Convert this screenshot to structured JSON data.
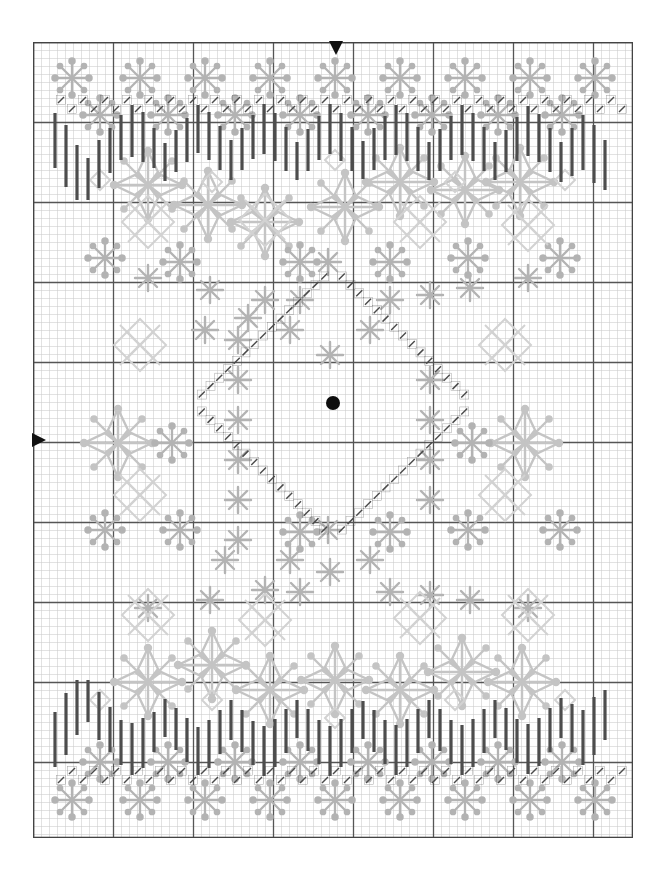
{
  "document": {
    "title": "Snowflake Blackwork Cross-Stitch Chart",
    "type": "stitch-pattern-chart"
  },
  "grid": {
    "cell_size_px": 8,
    "bold_every_n_cells": 10,
    "columns": 75,
    "rows": 99,
    "origin_x_px": 33,
    "origin_y_px": 42,
    "width_px": 600,
    "height_px": 796,
    "fine_line_color": "#c9c9c9",
    "bold_line_color": "#555555",
    "border_color": "#444444",
    "background_color": "#ffffff"
  },
  "palette": {
    "motif_light_grey": "#c4c4c4",
    "motif_mid_grey": "#b3b3b3",
    "motif_pale_grey": "#d2d2d2",
    "backstitch_dark": "#4a4a4a",
    "border_bar_dark": "#4d4d4d",
    "center_dot": "#0d0d0d",
    "arrow_marker": "#111111"
  },
  "markers": {
    "center_dot": {
      "name": "center-point",
      "x_px": 333,
      "y_px": 403,
      "radius_px": 7,
      "color": "#0d0d0d"
    },
    "top_arrow": {
      "name": "top-center-arrow",
      "direction": "down",
      "x_px": 336,
      "y_px": 47,
      "color": "#111111"
    },
    "left_arrow": {
      "name": "left-center-arrow",
      "direction": "right",
      "x_px": 38,
      "y_px": 440,
      "color": "#111111"
    }
  },
  "legend": {
    "symbols": [
      {
        "key": "large-snowflake",
        "label": "Large 8-point snowflake",
        "color": "#c4c4c4"
      },
      {
        "key": "six-spoke-star",
        "label": "Six-spoke dotted star",
        "color": "#bdbdbd"
      },
      {
        "key": "asterisk-star",
        "label": "Small asterisk star",
        "color": "#b5b5b5"
      },
      {
        "key": "diamond-cluster",
        "label": "Four diamond cluster",
        "color": "#c8c8c8"
      },
      {
        "key": "single-diamond",
        "label": "Single small diamond",
        "color": "#cccccc"
      },
      {
        "key": "border-bar",
        "label": "Vertical border bar",
        "color": "#4d4d4d"
      },
      {
        "key": "backstitch",
        "label": "Backstitch tick",
        "color": "#4a4a4a"
      }
    ]
  },
  "chart_data": {
    "type": "pattern-chart",
    "grid_columns": 75,
    "grid_rows": 99,
    "border_bars": {
      "note": "Dark vertical bars forming zigzag border bands top and bottom",
      "top_band_y_px": 100,
      "bottom_band_y_px": 700,
      "bars": [
        {
          "x": 55,
          "y": 113,
          "h": 55
        },
        {
          "x": 66,
          "y": 125,
          "h": 62
        },
        {
          "x": 77,
          "y": 145,
          "h": 55
        },
        {
          "x": 88,
          "y": 158,
          "h": 42
        },
        {
          "x": 99,
          "y": 140,
          "h": 48
        },
        {
          "x": 110,
          "y": 128,
          "h": 45
        },
        {
          "x": 121,
          "y": 115,
          "h": 45
        },
        {
          "x": 132,
          "y": 105,
          "h": 52
        },
        {
          "x": 143,
          "y": 112,
          "h": 50
        },
        {
          "x": 154,
          "y": 128,
          "h": 40
        },
        {
          "x": 165,
          "y": 143,
          "h": 38
        },
        {
          "x": 176,
          "y": 130,
          "h": 42
        },
        {
          "x": 187,
          "y": 118,
          "h": 44
        },
        {
          "x": 198,
          "y": 105,
          "h": 48
        },
        {
          "x": 209,
          "y": 112,
          "h": 48
        },
        {
          "x": 220,
          "y": 126,
          "h": 44
        },
        {
          "x": 231,
          "y": 140,
          "h": 40
        },
        {
          "x": 242,
          "y": 128,
          "h": 42
        },
        {
          "x": 253,
          "y": 115,
          "h": 44
        },
        {
          "x": 264,
          "y": 104,
          "h": 50
        },
        {
          "x": 275,
          "y": 113,
          "h": 48
        },
        {
          "x": 286,
          "y": 127,
          "h": 44
        },
        {
          "x": 297,
          "y": 142,
          "h": 38
        },
        {
          "x": 308,
          "y": 129,
          "h": 42
        },
        {
          "x": 319,
          "y": 116,
          "h": 44
        },
        {
          "x": 330,
          "y": 104,
          "h": 50
        },
        {
          "x": 341,
          "y": 113,
          "h": 48
        },
        {
          "x": 352,
          "y": 127,
          "h": 44
        },
        {
          "x": 363,
          "y": 141,
          "h": 38
        },
        {
          "x": 374,
          "y": 128,
          "h": 42
        },
        {
          "x": 385,
          "y": 116,
          "h": 44
        },
        {
          "x": 396,
          "y": 105,
          "h": 50
        },
        {
          "x": 407,
          "y": 113,
          "h": 48
        },
        {
          "x": 418,
          "y": 127,
          "h": 44
        },
        {
          "x": 429,
          "y": 142,
          "h": 38
        },
        {
          "x": 440,
          "y": 129,
          "h": 42
        },
        {
          "x": 451,
          "y": 116,
          "h": 44
        },
        {
          "x": 462,
          "y": 105,
          "h": 50
        },
        {
          "x": 473,
          "y": 113,
          "h": 48
        },
        {
          "x": 484,
          "y": 127,
          "h": 44
        },
        {
          "x": 495,
          "y": 142,
          "h": 38
        },
        {
          "x": 506,
          "y": 130,
          "h": 42
        },
        {
          "x": 517,
          "y": 117,
          "h": 44
        },
        {
          "x": 528,
          "y": 106,
          "h": 50
        },
        {
          "x": 539,
          "y": 114,
          "h": 48
        },
        {
          "x": 550,
          "y": 128,
          "h": 44
        },
        {
          "x": 561,
          "y": 142,
          "h": 40
        },
        {
          "x": 572,
          "y": 128,
          "h": 48
        },
        {
          "x": 583,
          "y": 115,
          "h": 55
        },
        {
          "x": 594,
          "y": 125,
          "h": 58
        },
        {
          "x": 605,
          "y": 140,
          "h": 50
        }
      ]
    },
    "motifs": {
      "large_snowflake_positions": [
        {
          "x": 148,
          "y": 185
        },
        {
          "x": 265,
          "y": 222
        },
        {
          "x": 345,
          "y": 207
        },
        {
          "x": 400,
          "y": 182
        },
        {
          "x": 465,
          "y": 190
        },
        {
          "x": 520,
          "y": 182
        },
        {
          "x": 208,
          "y": 205
        },
        {
          "x": 148,
          "y": 682
        },
        {
          "x": 212,
          "y": 665
        },
        {
          "x": 270,
          "y": 690
        },
        {
          "x": 335,
          "y": 680
        },
        {
          "x": 400,
          "y": 690
        },
        {
          "x": 462,
          "y": 672
        },
        {
          "x": 522,
          "y": 682
        },
        {
          "x": 525,
          "y": 443
        },
        {
          "x": 118,
          "y": 443
        }
      ],
      "six_spoke_star_positions": [
        {
          "x": 72,
          "y": 78
        },
        {
          "x": 140,
          "y": 78
        },
        {
          "x": 205,
          "y": 78
        },
        {
          "x": 270,
          "y": 78
        },
        {
          "x": 335,
          "y": 78
        },
        {
          "x": 400,
          "y": 78
        },
        {
          "x": 465,
          "y": 78
        },
        {
          "x": 530,
          "y": 78
        },
        {
          "x": 595,
          "y": 78
        },
        {
          "x": 100,
          "y": 115
        },
        {
          "x": 168,
          "y": 115
        },
        {
          "x": 235,
          "y": 115
        },
        {
          "x": 300,
          "y": 115
        },
        {
          "x": 368,
          "y": 115
        },
        {
          "x": 432,
          "y": 115
        },
        {
          "x": 498,
          "y": 115
        },
        {
          "x": 562,
          "y": 115
        },
        {
          "x": 72,
          "y": 800
        },
        {
          "x": 140,
          "y": 800
        },
        {
          "x": 205,
          "y": 800
        },
        {
          "x": 270,
          "y": 800
        },
        {
          "x": 335,
          "y": 800
        },
        {
          "x": 400,
          "y": 800
        },
        {
          "x": 465,
          "y": 800
        },
        {
          "x": 530,
          "y": 800
        },
        {
          "x": 595,
          "y": 800
        },
        {
          "x": 100,
          "y": 762
        },
        {
          "x": 168,
          "y": 762
        },
        {
          "x": 235,
          "y": 762
        },
        {
          "x": 300,
          "y": 762
        },
        {
          "x": 368,
          "y": 762
        },
        {
          "x": 432,
          "y": 762
        },
        {
          "x": 498,
          "y": 762
        },
        {
          "x": 562,
          "y": 762
        },
        {
          "x": 105,
          "y": 258
        },
        {
          "x": 180,
          "y": 262
        },
        {
          "x": 300,
          "y": 262
        },
        {
          "x": 390,
          "y": 262
        },
        {
          "x": 468,
          "y": 258
        },
        {
          "x": 560,
          "y": 258
        },
        {
          "x": 105,
          "y": 530
        },
        {
          "x": 180,
          "y": 530
        },
        {
          "x": 300,
          "y": 532
        },
        {
          "x": 390,
          "y": 532
        },
        {
          "x": 468,
          "y": 530
        },
        {
          "x": 560,
          "y": 530
        },
        {
          "x": 472,
          "y": 443
        },
        {
          "x": 172,
          "y": 443
        }
      ],
      "asterisk_star_positions": [
        {
          "x": 148,
          "y": 278
        },
        {
          "x": 210,
          "y": 290
        },
        {
          "x": 265,
          "y": 300
        },
        {
          "x": 300,
          "y": 300
        },
        {
          "x": 390,
          "y": 300
        },
        {
          "x": 430,
          "y": 295
        },
        {
          "x": 470,
          "y": 288
        },
        {
          "x": 528,
          "y": 278
        },
        {
          "x": 148,
          "y": 608
        },
        {
          "x": 210,
          "y": 600
        },
        {
          "x": 265,
          "y": 590
        },
        {
          "x": 300,
          "y": 592
        },
        {
          "x": 390,
          "y": 592
        },
        {
          "x": 430,
          "y": 595
        },
        {
          "x": 470,
          "y": 600
        },
        {
          "x": 528,
          "y": 608
        },
        {
          "x": 238,
          "y": 340
        },
        {
          "x": 238,
          "y": 380
        },
        {
          "x": 238,
          "y": 420
        },
        {
          "x": 238,
          "y": 460
        },
        {
          "x": 238,
          "y": 500
        },
        {
          "x": 238,
          "y": 540
        },
        {
          "x": 290,
          "y": 560
        },
        {
          "x": 330,
          "y": 572
        },
        {
          "x": 370,
          "y": 560
        },
        {
          "x": 205,
          "y": 330
        },
        {
          "x": 248,
          "y": 318
        },
        {
          "x": 290,
          "y": 330
        },
        {
          "x": 330,
          "y": 355
        },
        {
          "x": 370,
          "y": 330
        },
        {
          "x": 225,
          "y": 560
        },
        {
          "x": 430,
          "y": 380
        },
        {
          "x": 430,
          "y": 420
        },
        {
          "x": 430,
          "y": 460
        },
        {
          "x": 430,
          "y": 500
        },
        {
          "x": 328,
          "y": 262
        },
        {
          "x": 328,
          "y": 530
        }
      ],
      "diamond_cluster_positions": [
        {
          "x": 148,
          "y": 222
        },
        {
          "x": 265,
          "y": 220
        },
        {
          "x": 420,
          "y": 222
        },
        {
          "x": 528,
          "y": 225
        },
        {
          "x": 148,
          "y": 615
        },
        {
          "x": 265,
          "y": 620
        },
        {
          "x": 420,
          "y": 618
        },
        {
          "x": 528,
          "y": 615
        },
        {
          "x": 140,
          "y": 495
        },
        {
          "x": 505,
          "y": 495
        },
        {
          "x": 140,
          "y": 345
        },
        {
          "x": 505,
          "y": 345
        }
      ],
      "single_diamond_positions": [
        {
          "x": 100,
          "y": 180
        },
        {
          "x": 335,
          "y": 160
        },
        {
          "x": 565,
          "y": 180
        },
        {
          "x": 100,
          "y": 700
        },
        {
          "x": 335,
          "y": 718
        },
        {
          "x": 565,
          "y": 700
        },
        {
          "x": 212,
          "y": 182
        },
        {
          "x": 455,
          "y": 182
        },
        {
          "x": 212,
          "y": 700
        },
        {
          "x": 455,
          "y": 700
        }
      ]
    },
    "backstitch_diamond": {
      "note": "Diagonal backstitch tick lines forming a large diamond around center",
      "center_x_px": 333,
      "center_y_px": 403,
      "half_width_px": 140,
      "half_height_px": 135
    },
    "backstitch_border_rows": {
      "note": "Rows of small backstitch ticks above top border and below bottom border",
      "top_row_y_px": 100,
      "bottom_row_y_px": 775,
      "tick_spacing_px": 22
    }
  }
}
